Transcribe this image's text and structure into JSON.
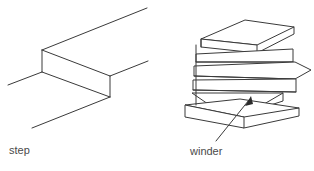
{
  "figure": {
    "background_color": "#ffffff",
    "ink_color": "#3a3a3a",
    "label_color": "#4a4a4a",
    "labels": {
      "step": "step",
      "winder": "winder"
    },
    "panels": [
      {
        "name": "step-diagram",
        "label": "step",
        "description": "isometric line drawing of a single straight stair step"
      },
      {
        "name": "winder-diagram",
        "label": "winder",
        "description": "isometric line drawing of a curved stair flight with wedge-shaped winder treads",
        "tread_count": 6,
        "annotation": {
          "type": "leader-arrow",
          "points_to": "winder-tread"
        }
      }
    ]
  }
}
